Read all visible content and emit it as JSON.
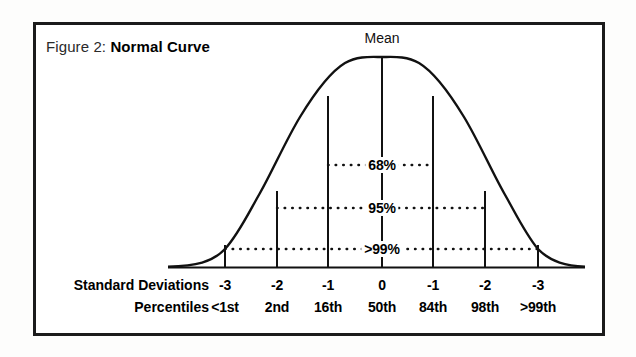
{
  "figure": {
    "caption_prefix": "Figure 2:",
    "caption_title": "Normal Curve",
    "mean_label": "Mean"
  },
  "rows": {
    "standard_deviations_label": "Standard Deviations",
    "percentiles_label": "Percentiles"
  },
  "chart_data": {
    "type": "line",
    "title": "Normal Curve",
    "subtitle": "Figure 2:",
    "curve": "gaussian",
    "xlabel": "Standard Deviations",
    "ylabel": "",
    "grid": false,
    "legend": null,
    "xlim": [
      -3.6,
      3.6
    ],
    "annotations": [
      {
        "text": "Mean",
        "x": 0,
        "position": "above-peak"
      },
      {
        "text": "68%",
        "span": [
          -1,
          1
        ],
        "level": 0.62
      },
      {
        "text": "95%",
        "span": [
          -2,
          2
        ],
        "level": 0.4
      },
      {
        "text": ">99%",
        "span": [
          -3,
          3
        ],
        "level": 0.16
      }
    ],
    "bands": [
      {
        "label": "68%",
        "from_sigma": -1,
        "to_sigma": 1
      },
      {
        "label": "95%",
        "from_sigma": -2,
        "to_sigma": 2
      },
      {
        "label": ">99%",
        "from_sigma": -3,
        "to_sigma": 3
      }
    ],
    "categories": [
      "-3",
      "-2",
      "-1",
      "0",
      "-1",
      "-2",
      "-3"
    ],
    "standard_deviations": [
      "-3",
      "-2",
      "-1",
      "0",
      "-1",
      "-2",
      "-3"
    ],
    "percentiles": [
      "<1st",
      "2nd",
      "16th",
      "50th",
      "84th",
      "98th",
      ">99th"
    ],
    "tick_x_px": [
      225,
      277,
      328,
      382,
      433,
      485,
      538
    ],
    "colors": {
      "curve": "#111111",
      "frame": "#1b1b1b",
      "text": "#000000",
      "background": "#ffffff"
    }
  }
}
